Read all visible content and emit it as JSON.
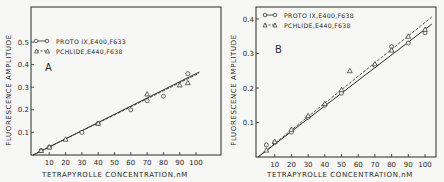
{
  "chart_data": [
    {
      "type": "scatter",
      "panel_label": "A",
      "title": "",
      "xlabel": "TETRAPYROLLE CONCENTRATION, nM",
      "ylabel": "FLUORESCENCE AMPLITUDE",
      "xlim": [
        0,
        105
      ],
      "ylim": [
        0,
        0.55
      ],
      "xticks": [
        10,
        20,
        30,
        40,
        50,
        60,
        70,
        80,
        90,
        100
      ],
      "yticks": [
        0.1,
        0.2,
        0.3,
        0.4,
        0.5
      ],
      "ytick_labels": [
        "0.1",
        "0.2",
        "0.3",
        "0.4",
        "0.5"
      ],
      "grid": false,
      "legend_position": "upper-left",
      "series": [
        {
          "name": "PROTO IX, E400, F633",
          "marker": "circle",
          "line": "solid",
          "x": [
            5,
            10,
            30,
            40,
            60,
            70,
            80,
            95
          ],
          "y": [
            0.02,
            0.035,
            0.1,
            0.14,
            0.2,
            0.24,
            0.26,
            0.36
          ],
          "fit": {
            "slope": 0.0036,
            "intercept": 0.0
          }
        },
        {
          "name": "PCHLIDE, E440, F638",
          "marker": "triangle",
          "line": "dashed",
          "x": [
            5,
            10,
            20,
            40,
            70,
            90,
            95
          ],
          "y": [
            0.02,
            0.035,
            0.07,
            0.14,
            0.27,
            0.31,
            0.32
          ],
          "fit": {
            "slope": 0.00355,
            "intercept": 0.0
          }
        }
      ]
    },
    {
      "type": "scatter",
      "panel_label": "B",
      "title": "",
      "xlabel": "TETRAPYROLLE CONCENTRATION, nM",
      "ylabel": "FLUORESCENCE AMPLITUDE",
      "xlim": [
        0,
        105
      ],
      "ylim": [
        0,
        0.43
      ],
      "xticks": [
        10,
        20,
        30,
        40,
        50,
        60,
        70,
        80,
        90,
        100
      ],
      "yticks": [
        0.1,
        0.2,
        0.3,
        0.4
      ],
      "ytick_labels": [
        "0.1",
        "0.2",
        "0.3",
        "0.4"
      ],
      "grid": false,
      "legend_position": "upper-left",
      "series": [
        {
          "name": "PROTO IX, E400, F638",
          "marker": "circle",
          "line": "solid",
          "x": [
            5,
            10,
            20,
            30,
            40,
            50,
            70,
            80,
            90,
            100
          ],
          "y": [
            0.035,
            0.042,
            0.072,
            0.115,
            0.15,
            0.185,
            0.265,
            0.32,
            0.33,
            0.36
          ],
          "fit": {
            "slope": 0.0037,
            "intercept": 0.0
          }
        },
        {
          "name": "PCHLIDE, E440, F638",
          "marker": "triangle",
          "line": "dashed",
          "x": [
            5,
            10,
            20,
            30,
            40,
            50,
            55,
            70,
            80,
            90,
            100
          ],
          "y": [
            0.02,
            0.045,
            0.08,
            0.12,
            0.155,
            0.195,
            0.25,
            0.27,
            0.31,
            0.35,
            0.37
          ],
          "fit": {
            "slope": 0.0039,
            "intercept": 0.0
          }
        }
      ]
    }
  ],
  "panels": [
    {
      "label": "A",
      "legend": [
        "PROTO IX,E400,F633",
        "PCHLIDE,E440,F638"
      ],
      "xlabel": "TETRAPYROLLE CONCENTRATION,nM",
      "ylabel": "FLUORESCENCE AMPLITUDE"
    },
    {
      "label": "B",
      "legend": [
        "PROTO IX,E400,F638",
        "PCHLIDE,E440,F638"
      ],
      "xlabel": "TETRAPYROLLE CONCENTRATION,nM",
      "ylabel": "FLUORESCENCE AMPLITUDE"
    }
  ],
  "colors": {
    "ink": "#2a2a2a",
    "background": "#f7f7f5"
  }
}
